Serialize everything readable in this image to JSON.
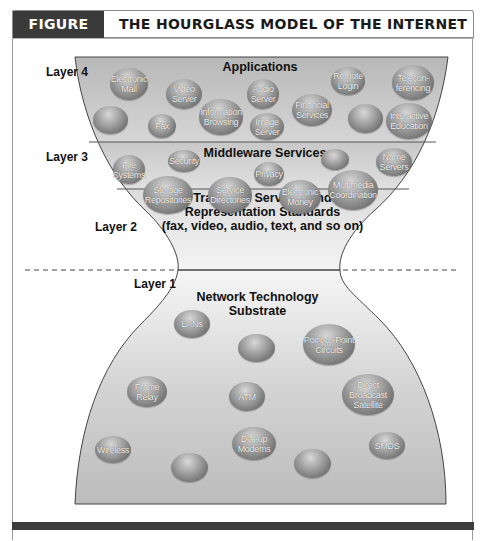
{
  "figure": {
    "label": "FIGURE 3.11",
    "title": "THE HOURGLASS MODEL OF THE INTERNET"
  },
  "layers": [
    {
      "id": "layer4",
      "label": "Layer 4",
      "title": "Applications",
      "bubbles": [
        "Electronic Mail",
        "Video Server",
        "Audio Server",
        "Remote Login",
        "Telecon-ferencing",
        "",
        "Fax",
        "Information Browsing",
        "Image Server",
        "Financial Services",
        "",
        "Interactive Education"
      ]
    },
    {
      "id": "layer3",
      "label": "Layer 3",
      "title": "Middleware Services",
      "bubbles": [
        "File Systems",
        "Security",
        "Privacy",
        "",
        "Name Servers",
        "Storage Repositories",
        "Service Directories",
        "Electronic Money",
        "Multimedia Coordination"
      ]
    },
    {
      "id": "layer2",
      "label": "Layer 2",
      "title_lines": [
        "Transport Services and",
        "Representation Standards",
        "(fax, video, audio, text, and so on)"
      ]
    },
    {
      "id": "layer1",
      "label": "Layer 1",
      "title": "Network Technology Substrate",
      "bubbles": [
        "LANs",
        "",
        "Point-to-Point Circuits",
        "Frame Relay",
        "ATM",
        "Direct Broadcast Satellite",
        "Wireless",
        "",
        "Dial-up Modems",
        "",
        "SMDS"
      ]
    }
  ],
  "colors": {
    "header_dark": "#3a3a3a",
    "fill_gray": "#c4c4c4",
    "fill_light": "#efefef",
    "outline": "#444444"
  }
}
